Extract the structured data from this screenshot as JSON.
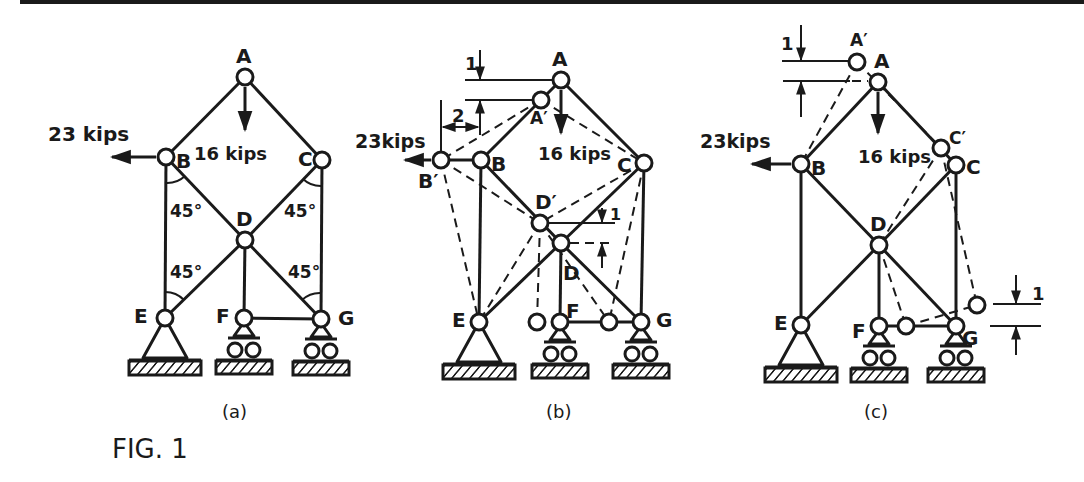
{
  "figure": {
    "title": "FIG. 1",
    "colors": {
      "ink": "#1a1a1a",
      "background": "#ffffff"
    }
  },
  "panels": [
    {
      "id": "a",
      "caption": "(a)",
      "nodes": {
        "A": "A",
        "B": "B",
        "C": "C",
        "D": "D",
        "E": "E",
        "F": "F",
        "G": "G"
      },
      "loads": {
        "horizontal": "23 kips",
        "vertical": "16 kips"
      },
      "angles": [
        "45°",
        "45°",
        "45°",
        "45°"
      ]
    },
    {
      "id": "b",
      "caption": "(b)",
      "nodes": {
        "A": "A",
        "A_prime": "A′",
        "B": "B",
        "B_prime": "B′",
        "C": "C",
        "D": "D",
        "D_prime": "D′",
        "E": "E",
        "F": "F",
        "G": "G"
      },
      "loads": {
        "horizontal": "23kips",
        "vertical": "16 kips"
      },
      "dimensions": {
        "vertical_top": "1",
        "horizontal": "2",
        "vertical_d": "1"
      }
    },
    {
      "id": "c",
      "caption": "(c)",
      "nodes": {
        "A": "A",
        "A_prime": "A′",
        "B": "B",
        "C": "C",
        "C_prime": "C′",
        "D": "D",
        "E": "E",
        "F": "F",
        "G": "G"
      },
      "loads": {
        "horizontal": "23kips",
        "vertical": "16 kips"
      },
      "dimensions": {
        "vertical_top": "1",
        "vertical_g": "1"
      }
    }
  ]
}
